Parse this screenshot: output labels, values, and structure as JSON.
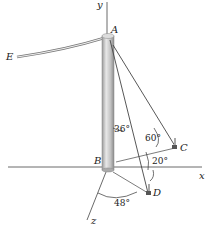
{
  "labels": {
    "y": "y",
    "x": "x",
    "z": "z",
    "A": "A",
    "B": "B",
    "C": "C",
    "D": "D",
    "E": "E"
  },
  "angles": {
    "a36": "36°",
    "a60": "60°",
    "a20": "20°",
    "a48": "48°"
  },
  "colors": {
    "pole": "#c8c8c8",
    "line": "#444444"
  }
}
